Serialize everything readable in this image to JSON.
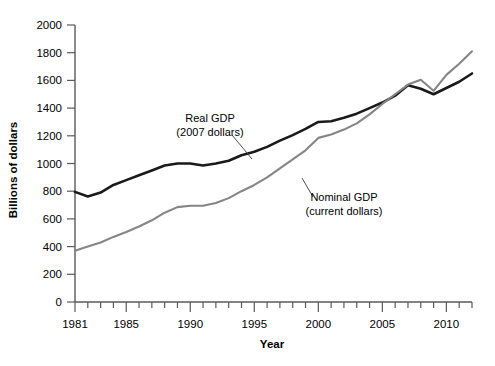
{
  "chart_data": {
    "type": "line",
    "title": "",
    "xlabel": "Year",
    "ylabel": "Billions of dollars",
    "xlim": [
      1981,
      2012
    ],
    "ylim": [
      0,
      2000
    ],
    "grid": false,
    "legend_position": "inline-annotations",
    "y_ticks": [
      0,
      200,
      400,
      600,
      800,
      1000,
      1200,
      1400,
      1600,
      1800,
      2000
    ],
    "y_tick_labels": [
      "0",
      "200",
      "400",
      "600",
      "800",
      "1000",
      "1200",
      "1400",
      "1600",
      "1800",
      "2000"
    ],
    "x_ticks": [
      1981,
      1982,
      1983,
      1984,
      1985,
      1986,
      1987,
      1988,
      1989,
      1990,
      1991,
      1992,
      1993,
      1994,
      1995,
      1996,
      1997,
      1998,
      1999,
      2000,
      2001,
      2002,
      2003,
      2004,
      2005,
      2006,
      2007,
      2008,
      2009,
      2010,
      2011,
      2012
    ],
    "x_tick_labels_major": [
      "1981",
      "1985",
      "1990",
      "1995",
      "2000",
      "2005",
      "2010"
    ],
    "x_major_years": [
      1981,
      1985,
      1990,
      1995,
      2000,
      2005,
      2010
    ],
    "x": [
      1981,
      1982,
      1983,
      1984,
      1985,
      1986,
      1987,
      1988,
      1989,
      1990,
      1991,
      1992,
      1993,
      1994,
      1995,
      1996,
      1997,
      1998,
      1999,
      2000,
      2001,
      2002,
      2003,
      2004,
      2005,
      2006,
      2007,
      2008,
      2009,
      2010,
      2011,
      2012
    ],
    "series": [
      {
        "name": "Real GDP",
        "sublabel": "(2007 dollars)",
        "color": "#1a1a1a",
        "stroke_width": 2.6,
        "values": [
          795,
          762,
          790,
          845,
          880,
          915,
          950,
          985,
          1000,
          1000,
          985,
          1000,
          1020,
          1060,
          1085,
          1120,
          1165,
          1205,
          1250,
          1300,
          1305,
          1330,
          1360,
          1400,
          1440,
          1490,
          1565,
          1540,
          1500,
          1545,
          1590,
          1650
        ]
      },
      {
        "name": "Nominal GDP",
        "sublabel": "(current dollars)",
        "color": "#858585",
        "stroke_width": 2.1,
        "values": [
          370,
          400,
          430,
          470,
          505,
          545,
          590,
          645,
          685,
          695,
          695,
          715,
          750,
          800,
          845,
          900,
          965,
          1030,
          1095,
          1185,
          1210,
          1245,
          1290,
          1355,
          1430,
          1500,
          1570,
          1605,
          1525,
          1640,
          1720,
          1810
        ]
      }
    ],
    "annotations": [
      {
        "name": "real-gdp-annotation",
        "line1": "Real GDP",
        "line2": "(2007 dollars)",
        "text_x": 210,
        "text_y": 122,
        "leader": {
          "x1": 232,
          "y1": 135,
          "x2": 252,
          "y2": 159
        }
      },
      {
        "name": "nominal-gdp-annotation",
        "line1": "Nominal GDP",
        "line2": "(current dollars)",
        "text_x": 344,
        "text_y": 201,
        "leader": {
          "x1": 313,
          "y1": 197,
          "x2": 302,
          "y2": 178
        }
      }
    ]
  },
  "axes": {
    "y_axis_title": "Billions of dollars",
    "x_axis_title": "Year"
  }
}
